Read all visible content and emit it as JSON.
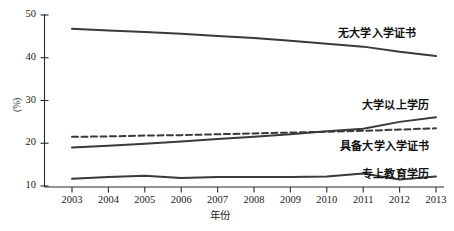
{
  "chart_data": {
    "type": "line",
    "title": "",
    "xlabel": "年份",
    "ylabel": "(%)",
    "xlim": [
      2003,
      2013
    ],
    "ylim": [
      10,
      50
    ],
    "yticks": [
      10,
      20,
      30,
      40,
      50
    ],
    "grid": false,
    "legend_position": "inline-right",
    "categories": [
      "2003",
      "2004",
      "2005",
      "2006",
      "2007",
      "2008",
      "2009",
      "2010",
      "2011",
      "2012",
      "2013"
    ],
    "series": [
      {
        "name": "无大学入学证书",
        "style": "solid",
        "color": "#3a3a3a",
        "values": [
          46.8,
          46.4,
          46.0,
          45.6,
          45.1,
          44.6,
          44.0,
          43.3,
          42.6,
          41.4,
          40.4
        ]
      },
      {
        "name": "具备大学入学证书",
        "style": "dashed",
        "color": "#3a3a3a",
        "values": [
          21.5,
          21.6,
          21.8,
          21.9,
          22.1,
          22.3,
          22.5,
          22.7,
          22.9,
          23.2,
          23.5
        ]
      },
      {
        "name": "大学以上学历",
        "style": "solid",
        "color": "#3a3a3a",
        "values": [
          19.0,
          19.4,
          19.9,
          20.4,
          21.0,
          21.5,
          22.1,
          22.8,
          23.4,
          25.0,
          26.1
        ]
      },
      {
        "name": "专上教育学历",
        "style": "solid",
        "color": "#3a3a3a",
        "values": [
          11.7,
          12.1,
          12.4,
          11.9,
          12.1,
          12.1,
          12.1,
          12.2,
          12.9,
          11.5,
          12.2
        ]
      }
    ],
    "annotations": [
      {
        "text": "无大学入学证书",
        "series": "无大学入学证书"
      },
      {
        "text": "大学以上学历",
        "series": "大学以上学历"
      },
      {
        "text": "具备大学入学证书",
        "series": "具备大学入学证书"
      },
      {
        "text": "专上教育学历",
        "series": "专上教育学历"
      }
    ]
  }
}
